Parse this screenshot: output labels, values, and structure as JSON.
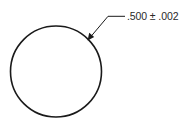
{
  "drawing": {
    "type": "engineering-dimension",
    "shape": "circle",
    "dimension": {
      "label": ".500 ± .002",
      "nominal": ".500",
      "tolerance_symbol": "±",
      "tolerance": ".002"
    },
    "leader": {
      "has_arrowhead": true,
      "style": "bent leader with horizontal shoulder"
    },
    "colors": {
      "line": "#1a1a1a",
      "text": "#2a2a2a",
      "background": "#ffffff"
    }
  }
}
